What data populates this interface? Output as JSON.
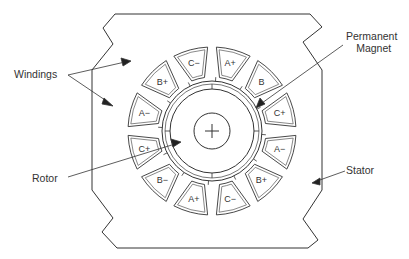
{
  "diagram": {
    "type": "cross-section",
    "labels": {
      "windings": "Windings",
      "permanent_magnet_line1": "Permanent",
      "permanent_magnet_line2": "Magnet",
      "rotor": "Rotor",
      "stator": "Stator"
    },
    "slots": [
      {
        "label": "C−",
        "angle": -105
      },
      {
        "label": "A+",
        "angle": -75
      },
      {
        "label": "B",
        "angle": -45
      },
      {
        "label": "C+",
        "angle": -15
      },
      {
        "label": "A−",
        "angle": 15
      },
      {
        "label": "B+",
        "angle": 45
      },
      {
        "label": "C−",
        "angle": 75
      },
      {
        "label": "A+",
        "angle": 105
      },
      {
        "label": "B−",
        "angle": 135
      },
      {
        "label": "C+",
        "angle": 165
      },
      {
        "label": "A−",
        "angle": 195
      },
      {
        "label": "B+",
        "angle": 225
      }
    ],
    "colors": {
      "line": "#333333",
      "background": "#ffffff"
    }
  }
}
